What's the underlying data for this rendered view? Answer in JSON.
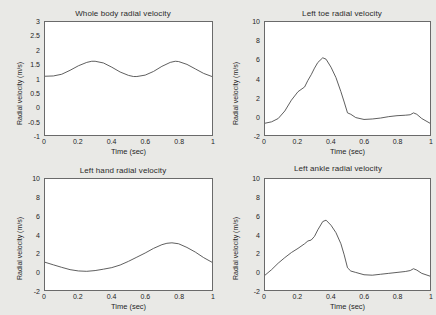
{
  "figure": {
    "background": "#e9e9e6",
    "axes_color": "#6a6a6a",
    "line_color": "#4a4a4a",
    "panel_count": 4
  },
  "chart_data": [
    {
      "type": "line",
      "title": "Whole body radial velocity",
      "xlabel": "Time (sec)",
      "ylabel": "Radial velocity (m/s)",
      "xlim": [
        0,
        1
      ],
      "ylim": [
        -1,
        3
      ],
      "xticks": [
        0,
        0.2,
        0.4,
        0.6,
        0.8,
        1
      ],
      "xticklabels": [
        "0",
        "0.2",
        "0.4",
        "0.6",
        "0.8",
        "1"
      ],
      "yticks": [
        -1,
        -0.5,
        0,
        0.5,
        1,
        1.5,
        2,
        2.5,
        3
      ],
      "yticklabels": [
        "-1",
        "-0.5",
        "0",
        "0.5",
        "1",
        "1.5",
        "2",
        "2.5",
        "3"
      ],
      "grid": false,
      "legend": null,
      "x": [
        0,
        0.05,
        0.1,
        0.15,
        0.2,
        0.25,
        0.28,
        0.3,
        0.35,
        0.4,
        0.45,
        0.5,
        0.53,
        0.55,
        0.6,
        0.65,
        0.7,
        0.75,
        0.78,
        0.8,
        0.85,
        0.9,
        0.95,
        1.0
      ],
      "y": [
        1.08,
        1.09,
        1.15,
        1.29,
        1.45,
        1.57,
        1.61,
        1.61,
        1.55,
        1.4,
        1.23,
        1.11,
        1.07,
        1.07,
        1.12,
        1.25,
        1.43,
        1.57,
        1.61,
        1.6,
        1.5,
        1.34,
        1.18,
        1.07
      ]
    },
    {
      "type": "line",
      "title": "Left toe radial velocity",
      "xlabel": "Time (sec)",
      "ylabel": "Radial velocity (m/s)",
      "xlim": [
        0,
        1
      ],
      "ylim": [
        -2,
        10
      ],
      "xticks": [
        0,
        0.2,
        0.4,
        0.6,
        0.8,
        1
      ],
      "xticklabels": [
        "0",
        "0.2",
        "0.4",
        "0.6",
        "0.8",
        "1"
      ],
      "yticks": [
        -2,
        0,
        2,
        4,
        6,
        8,
        10
      ],
      "yticklabels": [
        "-2",
        "0",
        "2",
        "4",
        "6",
        "8",
        "10"
      ],
      "grid": false,
      "legend": null,
      "x": [
        0,
        0.04,
        0.08,
        0.12,
        0.16,
        0.2,
        0.24,
        0.26,
        0.28,
        0.3,
        0.32,
        0.35,
        0.37,
        0.4,
        0.43,
        0.46,
        0.48,
        0.5,
        0.52,
        0.55,
        0.6,
        0.65,
        0.7,
        0.75,
        0.8,
        0.85,
        0.88,
        0.9,
        0.92,
        0.95,
        1.0
      ],
      "y": [
        -0.75,
        -0.6,
        -0.25,
        0.55,
        1.7,
        2.6,
        3.1,
        3.8,
        4.4,
        5.1,
        5.7,
        6.2,
        6.05,
        5.2,
        4.1,
        2.6,
        1.5,
        0.35,
        0.2,
        -0.15,
        -0.35,
        -0.3,
        -0.2,
        -0.05,
        0.05,
        0.1,
        0.15,
        0.35,
        0.2,
        -0.25,
        -0.75
      ]
    },
    {
      "type": "line",
      "title": "Left hand radial velocity",
      "xlabel": "Time (sec)",
      "ylabel": "Radial velocity (m/s)",
      "xlim": [
        0,
        1
      ],
      "ylim": [
        -2,
        10
      ],
      "xticks": [
        0,
        0.2,
        0.4,
        0.6,
        0.8,
        1
      ],
      "xticklabels": [
        "0",
        "0.2",
        "0.4",
        "0.6",
        "0.8",
        "1"
      ],
      "yticks": [
        -2,
        0,
        2,
        4,
        6,
        8,
        10
      ],
      "yticklabels": [
        "-2",
        "0",
        "2",
        "4",
        "6",
        "8",
        "10"
      ],
      "grid": false,
      "legend": null,
      "x": [
        0,
        0.05,
        0.1,
        0.15,
        0.2,
        0.25,
        0.3,
        0.35,
        0.4,
        0.45,
        0.5,
        0.55,
        0.6,
        0.65,
        0.7,
        0.73,
        0.76,
        0.8,
        0.85,
        0.9,
        0.95,
        1.0
      ],
      "y": [
        1.0,
        0.72,
        0.45,
        0.2,
        0.06,
        0.02,
        0.1,
        0.25,
        0.42,
        0.7,
        1.1,
        1.55,
        2.0,
        2.5,
        2.9,
        3.05,
        3.1,
        3.0,
        2.6,
        2.1,
        1.5,
        1.0
      ]
    },
    {
      "type": "line",
      "title": "Left ankle radial velocity",
      "xlabel": "Time (sec)",
      "ylabel": "Radial velocity (m/s)",
      "xlim": [
        0,
        1
      ],
      "ylim": [
        -2,
        10
      ],
      "xticks": [
        0,
        0.2,
        0.4,
        0.6,
        0.8,
        1
      ],
      "xticklabels": [
        "0",
        "0.2",
        "0.4",
        "0.6",
        "0.8",
        "1"
      ],
      "yticks": [
        -2,
        0,
        2,
        4,
        6,
        8,
        10
      ],
      "yticklabels": [
        "-2",
        "0",
        "2",
        "4",
        "6",
        "8",
        "10"
      ],
      "grid": false,
      "legend": null,
      "x": [
        0,
        0.04,
        0.08,
        0.12,
        0.16,
        0.2,
        0.24,
        0.26,
        0.28,
        0.3,
        0.32,
        0.35,
        0.37,
        0.4,
        0.43,
        0.46,
        0.48,
        0.5,
        0.52,
        0.55,
        0.6,
        0.65,
        0.7,
        0.75,
        0.8,
        0.85,
        0.88,
        0.9,
        0.92,
        0.95,
        1.0
      ],
      "y": [
        -0.4,
        0.2,
        0.9,
        1.5,
        2.05,
        2.5,
        3.0,
        3.3,
        3.4,
        3.8,
        4.5,
        5.4,
        5.55,
        5.0,
        4.2,
        3.0,
        1.8,
        0.4,
        0.05,
        -0.1,
        -0.35,
        -0.4,
        -0.3,
        -0.2,
        -0.1,
        0.0,
        0.1,
        0.3,
        0.15,
        -0.2,
        -0.5
      ]
    }
  ]
}
